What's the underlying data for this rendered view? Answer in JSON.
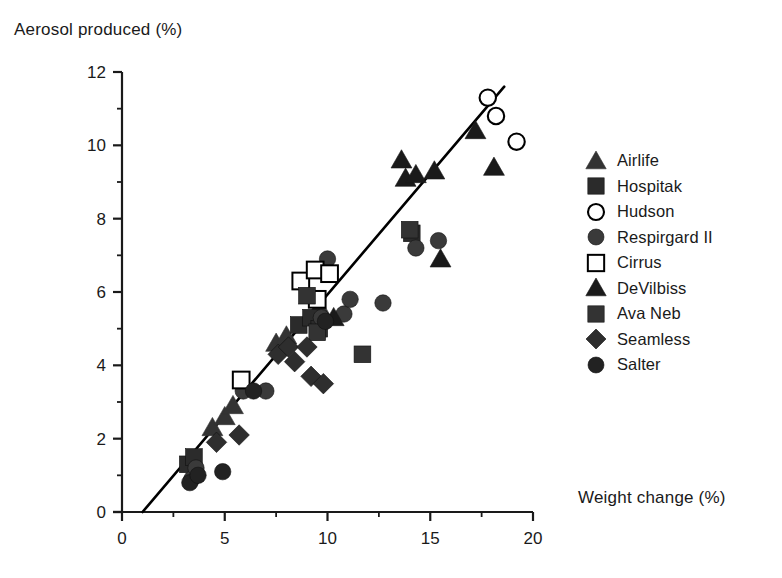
{
  "chart_data": {
    "type": "scatter",
    "title": "",
    "xlabel": "Weight change (%)",
    "ylabel": "Aerosol produced (%)",
    "xlim": [
      0,
      20
    ],
    "ylim": [
      0,
      12
    ],
    "xticks": [
      0,
      5,
      10,
      15,
      20
    ],
    "yticks": [
      0,
      2,
      4,
      6,
      8,
      10,
      12
    ],
    "xticklabels": [
      "0",
      "5",
      "10",
      "15",
      "20"
    ],
    "yticklabels": [
      "0",
      "2",
      "4",
      "6",
      "8",
      "10",
      "12"
    ],
    "x_minor_tick_interval": 2.5,
    "y_minor_tick_interval": 1,
    "grid": false,
    "legend_position": "right",
    "trendline": {
      "x": [
        1.0,
        18.6
      ],
      "y": [
        0.0,
        11.6
      ],
      "style": "solid",
      "color": "#000000"
    },
    "series": [
      {
        "name": "Airlife",
        "marker": "triangle-filled",
        "color": "#333333",
        "points": [
          {
            "x": 4.4,
            "y": 2.3
          },
          {
            "x": 5.0,
            "y": 2.6
          },
          {
            "x": 5.4,
            "y": 2.9
          },
          {
            "x": 7.5,
            "y": 4.6
          },
          {
            "x": 8.0,
            "y": 4.8
          },
          {
            "x": 9.6,
            "y": 5.6
          }
        ]
      },
      {
        "name": "Hospitak",
        "marker": "square-filled",
        "color": "#2b2b2b",
        "points": [
          {
            "x": 3.2,
            "y": 1.3
          },
          {
            "x": 3.5,
            "y": 1.5
          },
          {
            "x": 8.6,
            "y": 5.1
          },
          {
            "x": 9.2,
            "y": 5.3
          },
          {
            "x": 9.6,
            "y": 5.0
          },
          {
            "x": 14.1,
            "y": 7.6
          }
        ]
      },
      {
        "name": "Hudson",
        "marker": "circle-open",
        "color": "#000000",
        "points": [
          {
            "x": 17.8,
            "y": 11.3
          },
          {
            "x": 18.2,
            "y": 10.8
          },
          {
            "x": 19.2,
            "y": 10.1
          }
        ]
      },
      {
        "name": "Respirgard  II",
        "marker": "circle-filled",
        "color": "#3a3a3a",
        "points": [
          {
            "x": 3.4,
            "y": 0.9
          },
          {
            "x": 3.6,
            "y": 1.2
          },
          {
            "x": 5.9,
            "y": 3.3
          },
          {
            "x": 7.0,
            "y": 3.3
          },
          {
            "x": 9.7,
            "y": 5.3
          },
          {
            "x": 10.8,
            "y": 5.4
          },
          {
            "x": 10.0,
            "y": 6.9
          },
          {
            "x": 11.1,
            "y": 5.8
          },
          {
            "x": 12.7,
            "y": 5.7
          },
          {
            "x": 14.3,
            "y": 7.2
          },
          {
            "x": 15.4,
            "y": 7.4
          }
        ]
      },
      {
        "name": "Cirrus",
        "marker": "square-open",
        "color": "#000000",
        "points": [
          {
            "x": 5.8,
            "y": 3.6
          },
          {
            "x": 8.7,
            "y": 6.3
          },
          {
            "x": 9.4,
            "y": 6.6
          },
          {
            "x": 10.1,
            "y": 6.5
          },
          {
            "x": 9.5,
            "y": 5.8
          }
        ]
      },
      {
        "name": "DeVilbiss",
        "marker": "triangle-solid",
        "color": "#1a1a1a",
        "points": [
          {
            "x": 10.3,
            "y": 5.3
          },
          {
            "x": 13.6,
            "y": 9.6
          },
          {
            "x": 13.8,
            "y": 9.1
          },
          {
            "x": 14.3,
            "y": 9.2
          },
          {
            "x": 15.2,
            "y": 9.3
          },
          {
            "x": 15.5,
            "y": 6.9
          },
          {
            "x": 17.2,
            "y": 10.4
          },
          {
            "x": 18.1,
            "y": 9.4
          }
        ]
      },
      {
        "name": "Ava  Neb",
        "marker": "square-textured",
        "color": "#333333",
        "points": [
          {
            "x": 9.0,
            "y": 5.9
          },
          {
            "x": 9.5,
            "y": 4.9
          },
          {
            "x": 11.7,
            "y": 4.3
          },
          {
            "x": 14.0,
            "y": 7.7
          }
        ]
      },
      {
        "name": "Seamless",
        "marker": "diamond-filled",
        "color": "#2e2e2e",
        "points": [
          {
            "x": 4.6,
            "y": 1.9
          },
          {
            "x": 5.7,
            "y": 2.1
          },
          {
            "x": 7.6,
            "y": 4.3
          },
          {
            "x": 8.1,
            "y": 4.5
          },
          {
            "x": 8.4,
            "y": 4.1
          },
          {
            "x": 9.0,
            "y": 4.5
          },
          {
            "x": 9.2,
            "y": 3.7
          },
          {
            "x": 9.8,
            "y": 3.5
          }
        ]
      },
      {
        "name": "Salter",
        "marker": "circle-filled-dark",
        "color": "#222222",
        "points": [
          {
            "x": 3.3,
            "y": 0.8
          },
          {
            "x": 3.7,
            "y": 1.0
          },
          {
            "x": 4.9,
            "y": 1.1
          },
          {
            "x": 6.4,
            "y": 3.3
          },
          {
            "x": 9.9,
            "y": 5.2
          }
        ]
      }
    ]
  },
  "legend": {
    "items": [
      {
        "label": "Airlife",
        "marker": "triangle-filled"
      },
      {
        "label": "Hospitak",
        "marker": "square-filled"
      },
      {
        "label": "Hudson",
        "marker": "circle-open"
      },
      {
        "label": "Respirgard  II",
        "marker": "circle-filled"
      },
      {
        "label": "Cirrus",
        "marker": "square-open"
      },
      {
        "label": "DeVilbiss",
        "marker": "triangle-solid"
      },
      {
        "label": "Ava  Neb",
        "marker": "square-textured"
      },
      {
        "label": "Seamless",
        "marker": "diamond-filled"
      },
      {
        "label": "Salter",
        "marker": "circle-filled-dark"
      }
    ]
  }
}
